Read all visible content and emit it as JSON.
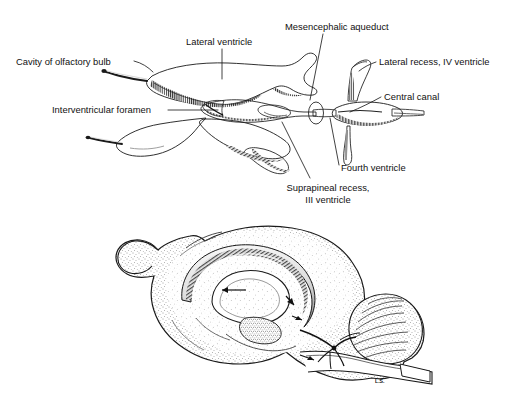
{
  "figure": {
    "title_visible": false,
    "signature": "L.S.",
    "panels": [
      {
        "name": "ventricular-cast-dorsal-view",
        "description": "Dorsal view of a cast of the ventricular system"
      },
      {
        "name": "brain-sagittal-section",
        "description": "Midsagittal section of the brain showing ventricles in situ"
      }
    ]
  },
  "labels": [
    {
      "id": "cavity-of-olfactory-bulb",
      "text": "Cavity of olfactory bulb",
      "x": 16,
      "y": 65,
      "anchor": "start"
    },
    {
      "id": "lateral-ventricle",
      "text": "Lateral ventricle",
      "x": 186,
      "y": 45,
      "anchor": "start"
    },
    {
      "id": "mesencephalic-aqueduct",
      "text": "Mesencephalic aqueduct",
      "x": 285,
      "y": 30,
      "anchor": "start"
    },
    {
      "id": "lateral-recess-iv-ventricle",
      "text": "Lateral recess, IV ventricle",
      "x": 379,
      "y": 65,
      "anchor": "start"
    },
    {
      "id": "central-canal",
      "text": "Central canal",
      "x": 384,
      "y": 100,
      "anchor": "start"
    },
    {
      "id": "interventricular-foramen",
      "text": "Interventricular foramen",
      "x": 52,
      "y": 113,
      "anchor": "start"
    },
    {
      "id": "fourth-ventricle",
      "text": "Fourth ventricle",
      "x": 341,
      "y": 171,
      "anchor": "start"
    },
    {
      "id": "suprapineal-recess-line1",
      "text": "Suprapineal recess,",
      "x": 328,
      "y": 191,
      "anchor": "middle"
    },
    {
      "id": "suprapineal-recess-line2",
      "text": "III ventricle",
      "x": 328,
      "y": 203,
      "anchor": "middle"
    }
  ],
  "colors": {
    "background": "#ffffff",
    "ink": "#111111",
    "cast_fill_light": "#f2f2f2",
    "cast_fill_mid": "#d8d8d8",
    "cast_fill_dark": "#9a9a9a",
    "brain_fill": "#efefef",
    "brain_shade": "#c9c9c9"
  }
}
